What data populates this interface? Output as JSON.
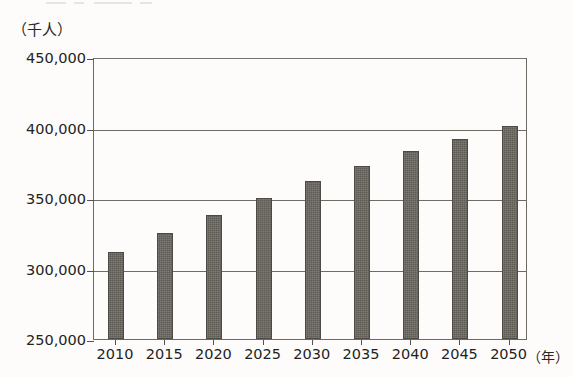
{
  "figure": {
    "cut_off_header": "",
    "y_unit_label": "（千人）",
    "x_unit_label": "（年）"
  },
  "chart_data": {
    "type": "bar",
    "title": "",
    "xlabel": "（年）",
    "ylabel": "（千人）",
    "categories": [
      "2010",
      "2015",
      "2020",
      "2025",
      "2030",
      "2035",
      "2040",
      "2045",
      "2050"
    ],
    "values": [
      312000,
      325000,
      338000,
      350000,
      362000,
      373000,
      383000,
      392000,
      401000
    ],
    "ylim": [
      250000,
      450000
    ],
    "ytick_labels": [
      "450,000",
      "400,000",
      "350,000",
      "300,000",
      "250,000"
    ],
    "yticks": [
      450000,
      400000,
      350000,
      300000,
      250000
    ],
    "grid": true,
    "legend": "none",
    "bar_color": "#5f5b55",
    "frame_color": "#6d6a64",
    "background_color": "#fdfcfa"
  }
}
